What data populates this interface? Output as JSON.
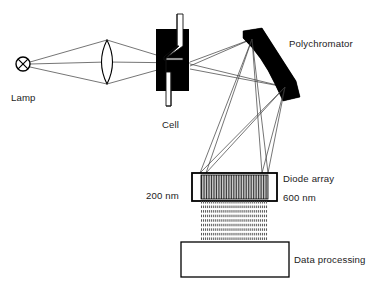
{
  "figure": {
    "background_color": "#ffffff",
    "ink_color": "#000000",
    "width": 384,
    "height": 286
  },
  "labels": {
    "lamp": "Lamp",
    "cell": "Cell",
    "polychromator": "Polychromator",
    "diode_array": "Diode array",
    "wavelength_low": "200 nm",
    "wavelength_high": "600 nm",
    "data_processing": "Data processing"
  },
  "components": {
    "lamp": {
      "name": "lamp-source",
      "shape": "circle-with-x",
      "cx": 23,
      "cy": 64,
      "r": 7
    },
    "lens": {
      "name": "condenser-lens",
      "shape": "biconvex-lens",
      "cx": 107,
      "cy": 62,
      "half_width": 10,
      "half_height": 22
    },
    "cell": {
      "name": "sample-cell",
      "shape": "black-block-with-z-flow-tube",
      "x": 156,
      "y": 29,
      "width": 33,
      "height": 62
    },
    "polychromator": {
      "name": "polychromator-grating",
      "shape": "concave-diffraction-grating",
      "orientation": "diagonal"
    },
    "diode_array": {
      "name": "diode-array-detector",
      "x": 192,
      "y": 173,
      "width": 85,
      "height": 28,
      "element_count": 40,
      "margin_color": "#ffffff",
      "stripe_color": "#2a2a2a"
    },
    "connector": {
      "name": "diode-array-connector",
      "x": 201,
      "y": 201,
      "width": 67,
      "height": 41,
      "rows": 9
    },
    "data_processing": {
      "name": "data-processing-unit",
      "x": 181,
      "y": 242,
      "width": 108,
      "height": 35
    }
  }
}
